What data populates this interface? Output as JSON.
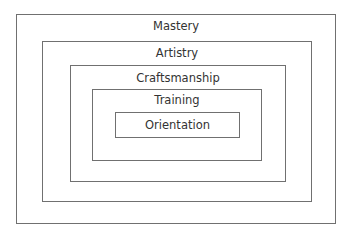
{
  "diagram": {
    "type": "nested-boxes",
    "levels": [
      {
        "label": "Mastery",
        "box": [
          16,
          14,
          320,
          210
        ]
      },
      {
        "label": "Artistry",
        "box": [
          42,
          41,
          270,
          161
        ]
      },
      {
        "label": "Craftsmanship",
        "box": [
          70,
          65,
          216,
          117
        ]
      },
      {
        "label": "Training",
        "box": [
          92,
          89,
          170,
          72
        ]
      },
      {
        "label": "Orientation",
        "box": [
          115,
          112,
          125,
          26
        ]
      }
    ],
    "colors": {
      "border": "#707070",
      "text": "#333333",
      "background": "#ffffff"
    }
  }
}
